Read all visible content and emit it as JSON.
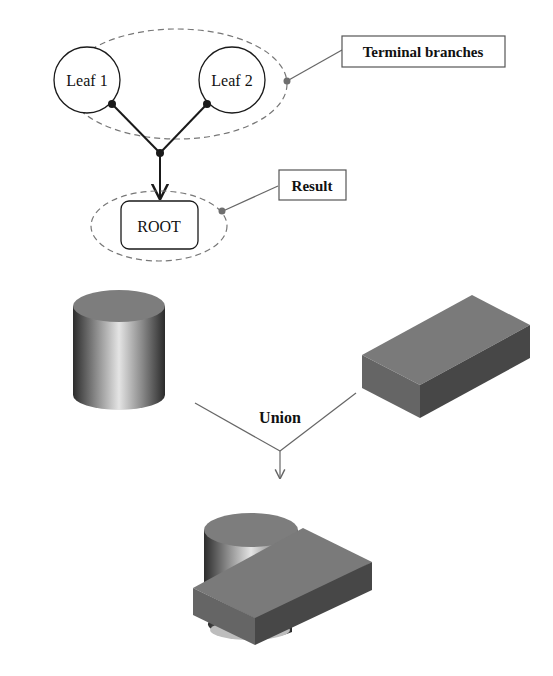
{
  "tree": {
    "leaves": [
      {
        "label": "Leaf 1"
      },
      {
        "label": "Leaf 2"
      }
    ],
    "root": {
      "label": "ROOT"
    },
    "callouts": {
      "terminal": "Terminal branches",
      "result": "Result"
    }
  },
  "operation": {
    "label": "Union"
  },
  "solids": {
    "operand_a": "cylinder",
    "operand_b": "box",
    "result": "cylinder-union-box"
  },
  "colors": {
    "stroke": "#1a1a1a",
    "dashed": "#777777",
    "callout_dot": "#6e6e6e",
    "solid_top": "#7d7d7d",
    "box_front": "#6a6a6a",
    "box_side": "#4a4a4a"
  }
}
